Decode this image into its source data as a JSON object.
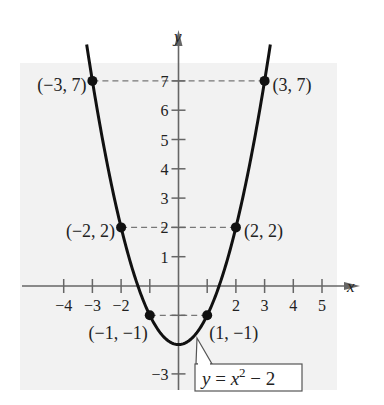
{
  "chart_data": {
    "type": "line",
    "title": "",
    "xlabel": "x",
    "ylabel": "y",
    "xlim": [
      -5,
      5
    ],
    "ylim": [
      -3,
      7
    ],
    "function": "y = x^2 - 2",
    "equation_label": {
      "lhs": "y = x",
      "exp": "2",
      "rhs": " − 2"
    },
    "x_ticks": [
      -4,
      -3,
      -2,
      -1,
      1,
      2,
      3,
      4,
      5
    ],
    "x_tick_labels": [
      {
        "v": -4,
        "t": "−4"
      },
      {
        "v": -3,
        "t": "−3"
      },
      {
        "v": -2,
        "t": "−2"
      },
      {
        "v": 2,
        "t": "2"
      },
      {
        "v": 3,
        "t": "3"
      },
      {
        "v": 4,
        "t": "4"
      },
      {
        "v": 5,
        "t": "5"
      }
    ],
    "y_ticks": [
      -3,
      -1,
      1,
      2,
      3,
      4,
      5,
      6,
      7
    ],
    "y_tick_labels": [
      {
        "v": 7,
        "t": "7"
      },
      {
        "v": 6,
        "t": "6"
      },
      {
        "v": 5,
        "t": "5"
      },
      {
        "v": 4,
        "t": "4"
      },
      {
        "v": 3,
        "t": "3"
      },
      {
        "v": 2,
        "t": "2"
      },
      {
        "v": 1,
        "t": "1"
      },
      {
        "v": -3,
        "t": "−3"
      }
    ],
    "points": [
      {
        "x": -3,
        "y": 7,
        "label": "(−3, 7)",
        "side": "left"
      },
      {
        "x": 3,
        "y": 7,
        "label": "(3, 7)",
        "side": "right"
      },
      {
        "x": -2,
        "y": 2,
        "label": "(−2, 2)",
        "side": "left"
      },
      {
        "x": 2,
        "y": 2,
        "label": "(2, 2)",
        "side": "right"
      },
      {
        "x": -1,
        "y": -1,
        "label": "(−1, −1)",
        "side": "below-left"
      },
      {
        "x": 1,
        "y": -1,
        "label": "(1, −1)",
        "side": "below-right"
      }
    ],
    "grid": false,
    "legend": "none"
  },
  "colors": {
    "background_panel": "#f2f2f2",
    "curve": "#111111",
    "axis": "#666666",
    "dashed": "#777777"
  }
}
